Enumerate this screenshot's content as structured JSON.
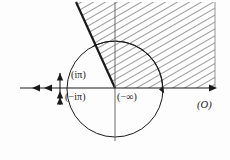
{
  "figure": {
    "kind": "complex-plane-branch-cut-diagram",
    "background_color": "#fdfdfd",
    "ink_color": "#1a1a1a",
    "hatch_color": "#4a4a4a",
    "labels": {
      "i_pi": "(iπ)",
      "minus_i_pi": "(−iπ)",
      "minus_infinity": "(−∞)",
      "origin": "(O)"
    },
    "geometry": {
      "real_axis": {
        "y": 88,
        "x_start": 20,
        "x_end": 217,
        "right_arrow": true,
        "left_arrows": 2,
        "left_arrow_x": [
          34,
          46
        ]
      },
      "imaginary_axis": {
        "x": 115,
        "y_top": 2,
        "y_bottom": 141
      },
      "circle": {
        "center_x": 115,
        "center_y": 89,
        "radius": 48,
        "stroke_width": 1.0
      },
      "branch_cut_segment": {
        "x": 60,
        "y_top": 74,
        "y_bottom": 104,
        "arrow_count": 3
      },
      "wedge": {
        "apex_x": 115,
        "apex_y": 88,
        "left_edge_top_x": 76,
        "left_edge_top_y": 2,
        "right_edge_x": 215,
        "top_y": 2,
        "hatched": true,
        "hatch_angle_deg": 60,
        "hatch_spacing": 6
      },
      "inner_arc": {
        "center_x": 115,
        "center_y": 89,
        "radius": 48,
        "start_angle_deg": 118,
        "end_angle_deg": 2,
        "has_arrowhead": true
      }
    }
  }
}
